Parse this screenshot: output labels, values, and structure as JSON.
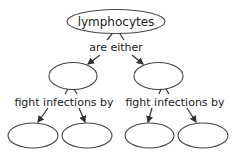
{
  "diagram": {
    "type": "concept-map",
    "root": {
      "label": "lymphocytes"
    },
    "root_link": {
      "label": "are either"
    },
    "branches": [
      {
        "node": {
          "label": ""
        },
        "link": {
          "label": "fight infections by"
        },
        "children": [
          {
            "label": ""
          },
          {
            "label": ""
          }
        ]
      },
      {
        "node": {
          "label": ""
        },
        "link": {
          "label": "fight infections by"
        },
        "children": [
          {
            "label": ""
          },
          {
            "label": ""
          }
        ]
      }
    ],
    "colors": {
      "stroke": "#444444",
      "text": "#222222",
      "background": "#ffffff"
    }
  }
}
